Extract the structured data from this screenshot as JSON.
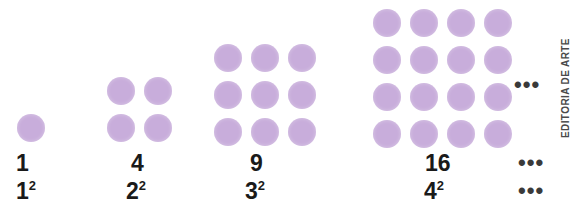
{
  "figure": {
    "dot_color": "#c8addb",
    "text_color": "#1a1a1a",
    "background": "#ffffff",
    "credit": "EDITORIA DE ARTE"
  },
  "groups": [
    {
      "side": 1,
      "dots": 1,
      "count_label": "1",
      "base": "1",
      "exponent": "2"
    },
    {
      "side": 2,
      "dots": 4,
      "count_label": "4",
      "base": "2",
      "exponent": "2"
    },
    {
      "side": 3,
      "dots": 9,
      "count_label": "9",
      "base": "3",
      "exponent": "2"
    },
    {
      "side": 4,
      "dots": 16,
      "count_label": "16",
      "base": "4",
      "exponent": "2"
    }
  ],
  "continuation": {
    "dots_row": "•••",
    "count_row": "•••",
    "square_row": "•••"
  },
  "chart_data": {
    "type": "bar",
    "categories": [
      "1²",
      "2²",
      "3²",
      "4²"
    ],
    "values": [
      1,
      4,
      9,
      16
    ],
    "xlabel": "",
    "ylabel": "",
    "legend": [],
    "grid": false
  }
}
